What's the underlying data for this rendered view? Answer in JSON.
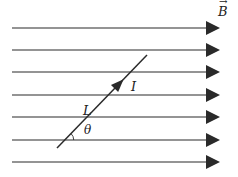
{
  "diagram": {
    "field_label": "B",
    "field_vector_arrow": "→",
    "current_label": "I",
    "length_label": "L",
    "angle_label": "θ",
    "field_lines_y": [
      28,
      50,
      72,
      95,
      117,
      140,
      162
    ],
    "field_line_x_start": 12,
    "field_line_x_end": 208,
    "wire": {
      "x1": 57,
      "y1": 148,
      "x2": 147,
      "y2": 55
    },
    "colors": {
      "line": "#2a2a2a",
      "background": "#ffffff"
    }
  }
}
